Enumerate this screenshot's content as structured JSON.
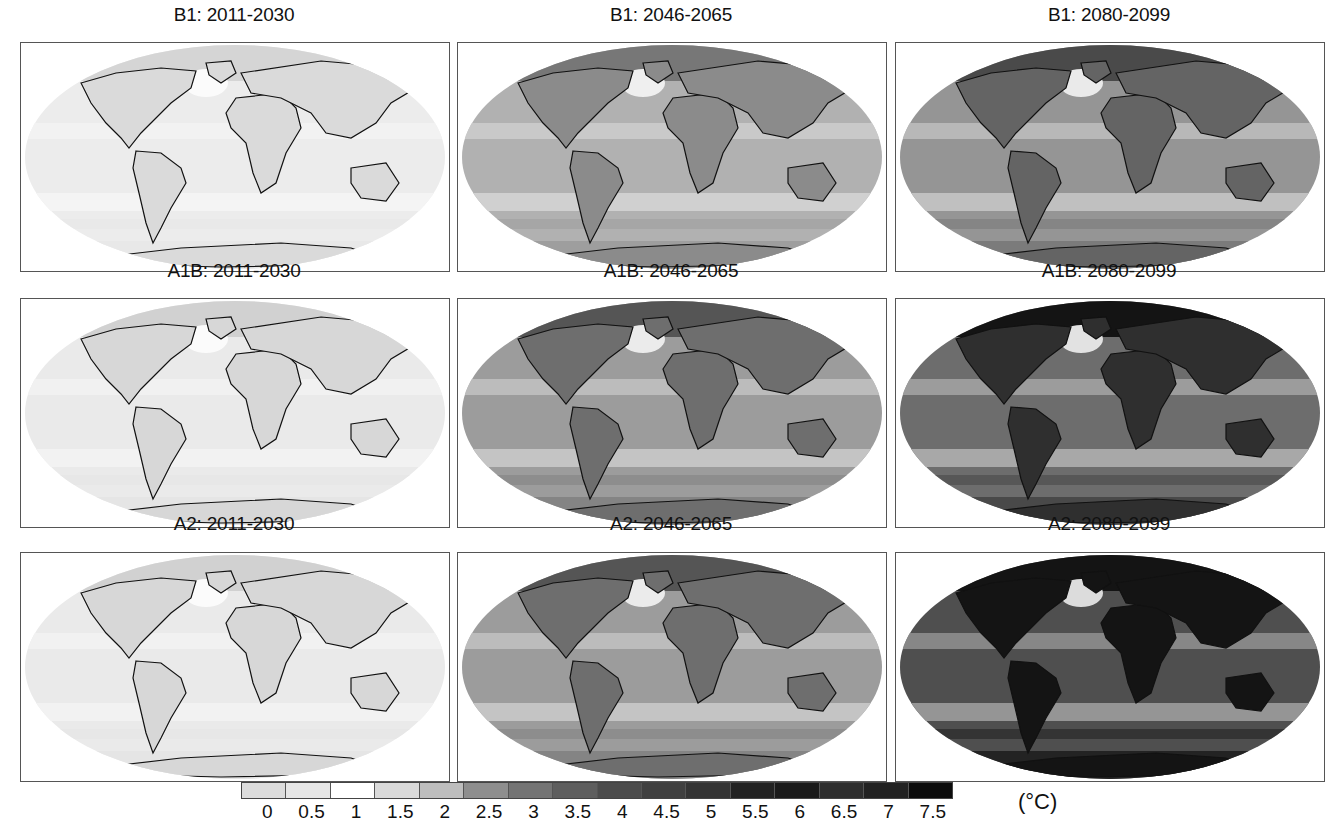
{
  "figure": {
    "panels": [
      {
        "title": "B1: 2011-2030",
        "row": 0,
        "col": 0,
        "intensity": 0.08
      },
      {
        "title": "B1: 2046-2065",
        "row": 0,
        "col": 1,
        "intensity": 0.33
      },
      {
        "title": "B1: 2080-2099",
        "row": 0,
        "col": 2,
        "intensity": 0.45
      },
      {
        "title": "A1B: 2011-2030",
        "row": 1,
        "col": 0,
        "intensity": 0.09
      },
      {
        "title": "A1B: 2046-2065",
        "row": 1,
        "col": 1,
        "intensity": 0.42
      },
      {
        "title": "A1B: 2080-2099",
        "row": 1,
        "col": 2,
        "intensity": 0.62
      },
      {
        "title": "A2: 2011-2030",
        "row": 2,
        "col": 0,
        "intensity": 0.09
      },
      {
        "title": "A2: 2046-2065",
        "row": 2,
        "col": 1,
        "intensity": 0.42
      },
      {
        "title": "A2: 2080-2099",
        "row": 2,
        "col": 2,
        "intensity": 0.75
      }
    ],
    "colorbar": {
      "tick_labels": [
        "0",
        "0.5",
        "1",
        "1.5",
        "2",
        "2.5",
        "3",
        "3.5",
        "4",
        "4.5",
        "5",
        "5.5",
        "6",
        "6.5",
        "7",
        "7.5"
      ],
      "swatch_colors": [
        "#dcdcdc",
        "#e6e6e6",
        "#ffffff",
        "#dadada",
        "#bdbdbd",
        "#8e8e8e",
        "#747474",
        "#5e5e5e",
        "#4c4c4c",
        "#404040",
        "#343434",
        "#222222",
        "#1a1a1a",
        "#2e2e2e",
        "#222222",
        "#0c0c0c"
      ],
      "unit": "(°C)"
    }
  },
  "chart_data": {
    "type": "heatmap",
    "rows": [
      "B1",
      "A1B",
      "A2"
    ],
    "columns": [
      "2011-2030",
      "2046-2065",
      "2080-2099"
    ],
    "panel_titles": [
      [
        "B1: 2011-2030",
        "B1: 2046-2065",
        "B1: 2080-2099"
      ],
      [
        "A1B: 2011-2030",
        "A1B: 2046-2065",
        "A1B: 2080-2099"
      ],
      [
        "A2: 2011-2030",
        "A2: 2046-2065",
        "A2: 2080-2099"
      ]
    ],
    "approx_typical_warming_C": [
      [
        0.5,
        1.5,
        2.0
      ],
      [
        0.5,
        2.0,
        3.0
      ],
      [
        0.5,
        2.0,
        3.5
      ]
    ],
    "colorbar_levels": [
      0,
      0.5,
      1,
      1.5,
      2,
      2.5,
      3,
      3.5,
      4,
      4.5,
      5,
      5.5,
      6,
      6.5,
      7,
      7.5
    ],
    "colorbar_unit": "(°C)",
    "projection": "Robinson-like global map, grayscale shading",
    "legend_position": "bottom"
  }
}
